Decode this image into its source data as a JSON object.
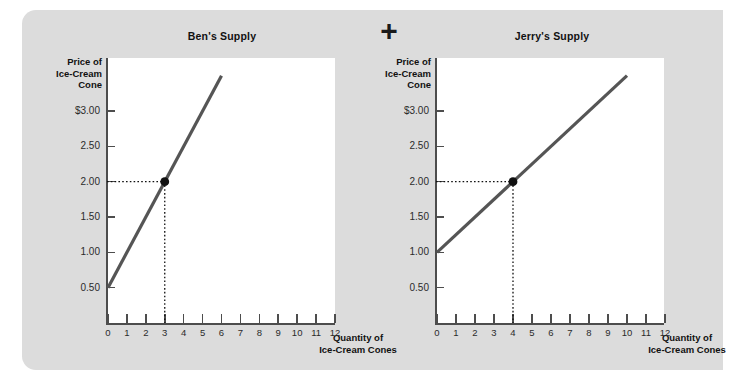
{
  "figure": {
    "operator": "+",
    "background_color": "#dcdcdc",
    "plot_background_color": "#ffffff",
    "line_color": "#555555",
    "axis_color": "#4d4d4d"
  },
  "charts": [
    {
      "id": "ben",
      "title": "Ben's Supply",
      "ylabel_lines": [
        "Price of",
        "Ice-Cream",
        "Cone"
      ],
      "xlabel_lines": [
        "Quantity of",
        "Ice-Cream Cones"
      ],
      "ytick_labels": [
        "$3.00",
        "2.50",
        "2.00",
        "1.50",
        "1.00",
        "0.50"
      ],
      "xtick_labels": [
        "0",
        "1",
        "2",
        "3",
        "4",
        "5",
        "6",
        "7",
        "8",
        "9",
        "10",
        "11",
        "12"
      ],
      "point_label": "(3, 2.00)"
    },
    {
      "id": "jerry",
      "title": "Jerry's Supply",
      "ylabel_lines": [
        "Price of",
        "Ice-Cream",
        "Cone"
      ],
      "xlabel_lines": [
        "Quantity of",
        "Ice-Cream Cones"
      ],
      "ytick_labels": [
        "$3.00",
        "2.50",
        "2.00",
        "1.50",
        "1.00",
        "0.50"
      ],
      "xtick_labels": [
        "0",
        "1",
        "2",
        "3",
        "4",
        "5",
        "6",
        "7",
        "8",
        "9",
        "10",
        "11",
        "12"
      ],
      "point_label": "(4, 2.00)"
    }
  ],
  "chart_data": [
    {
      "type": "line",
      "title": "Ben's Supply",
      "xlabel": "Quantity of Ice-Cream Cones",
      "ylabel": "Price of Ice-Cream Cone",
      "xlim": [
        0,
        12
      ],
      "ylim": [
        0,
        3.75
      ],
      "xticks": [
        0,
        1,
        2,
        3,
        4,
        5,
        6,
        7,
        8,
        9,
        10,
        11,
        12
      ],
      "yticks": [
        0.5,
        1.0,
        1.5,
        2.0,
        2.5,
        3.0
      ],
      "ytick_labels": [
        "0.50",
        "1.00",
        "1.50",
        "2.00",
        "2.50",
        "$3.00"
      ],
      "grid": false,
      "legend": false,
      "series": [
        {
          "name": "Ben's supply curve",
          "x": [
            0,
            6
          ],
          "y": [
            0.5,
            3.5
          ]
        }
      ],
      "markers": [
        {
          "name": "equilibrium-point",
          "x": 3,
          "y": 2.0,
          "guide_lines": "dotted to both axes"
        }
      ]
    },
    {
      "type": "line",
      "title": "Jerry's Supply",
      "xlabel": "Quantity of Ice-Cream Cones",
      "ylabel": "Price of Ice-Cream Cone",
      "xlim": [
        0,
        12
      ],
      "ylim": [
        0,
        3.75
      ],
      "xticks": [
        0,
        1,
        2,
        3,
        4,
        5,
        6,
        7,
        8,
        9,
        10,
        11,
        12
      ],
      "yticks": [
        0.5,
        1.0,
        1.5,
        2.0,
        2.5,
        3.0
      ],
      "ytick_labels": [
        "0.50",
        "1.00",
        "1.50",
        "2.00",
        "2.50",
        "$3.00"
      ],
      "grid": false,
      "legend": false,
      "series": [
        {
          "name": "Jerry's supply curve",
          "x": [
            0,
            10
          ],
          "y": [
            1.0,
            3.5
          ]
        }
      ],
      "markers": [
        {
          "name": "equilibrium-point",
          "x": 4,
          "y": 2.0,
          "guide_lines": "dotted to both axes"
        }
      ]
    }
  ]
}
